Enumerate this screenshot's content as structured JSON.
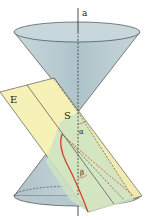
{
  "diagram": {
    "labels": {
      "axis": "a",
      "plane": "E",
      "apex": "S",
      "angle_alpha": "α",
      "angle_beta": "β"
    },
    "colors": {
      "cone_fill": "#b9cdd3",
      "cone_rim": "#a9bfc6",
      "plane_fill": "#f6f0b0",
      "plane_inside": "#cfe3c4",
      "curve": "#d0402a",
      "line": "#222222"
    }
  }
}
